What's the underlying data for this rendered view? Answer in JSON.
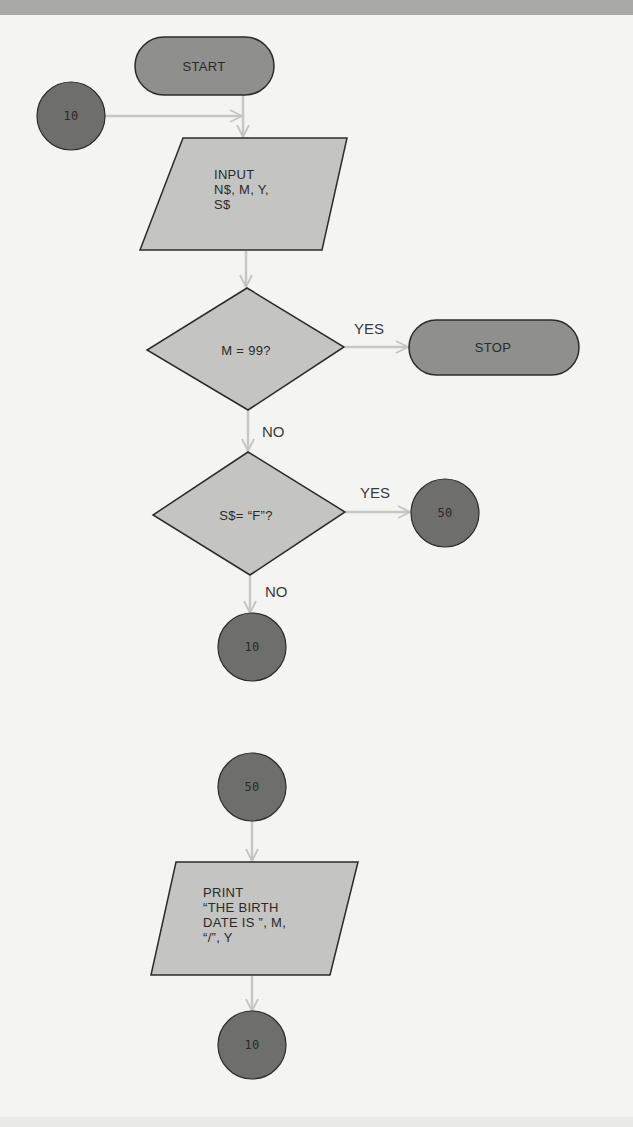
{
  "diagram": {
    "type": "flowchart",
    "colors": {
      "terminal_fill": "#8f8f8d",
      "connector_fill": "#6e6e6c",
      "process_fill": "#c4c4c2",
      "stroke": "#2b2b2b",
      "arrow": "#c7c7c7",
      "background": "#f4f4f2"
    },
    "nodes": {
      "start": {
        "shape": "terminal",
        "label": "START"
      },
      "connector_10_entry": {
        "shape": "connector",
        "label": "10"
      },
      "input": {
        "shape": "parallelogram",
        "label": "INPUT\nN$, M, Y,\nS$"
      },
      "decision_m": {
        "shape": "diamond",
        "label": "M = 99?"
      },
      "stop": {
        "shape": "terminal",
        "label": "STOP"
      },
      "decision_s": {
        "shape": "diamond",
        "label": "S$= “F”?"
      },
      "connector_50_out": {
        "shape": "connector",
        "label": "50"
      },
      "connector_10_loop": {
        "shape": "connector",
        "label": "10"
      },
      "connector_50_in": {
        "shape": "connector",
        "label": "50"
      },
      "print": {
        "shape": "parallelogram",
        "label": "PRINT\n“THE BIRTH\nDATE IS ”, M,\n“/”, Y"
      },
      "connector_10_end": {
        "shape": "connector",
        "label": "10"
      }
    },
    "edges": [
      {
        "from": "start",
        "to": "input",
        "label": ""
      },
      {
        "from": "connector_10_entry",
        "to": "input",
        "label": ""
      },
      {
        "from": "input",
        "to": "decision_m",
        "label": ""
      },
      {
        "from": "decision_m",
        "to": "stop",
        "label": "YES"
      },
      {
        "from": "decision_m",
        "to": "decision_s",
        "label": "NO"
      },
      {
        "from": "decision_s",
        "to": "connector_50_out",
        "label": "YES"
      },
      {
        "from": "decision_s",
        "to": "connector_10_loop",
        "label": "NO"
      },
      {
        "from": "connector_50_in",
        "to": "print",
        "label": ""
      },
      {
        "from": "print",
        "to": "connector_10_end",
        "label": ""
      }
    ]
  }
}
